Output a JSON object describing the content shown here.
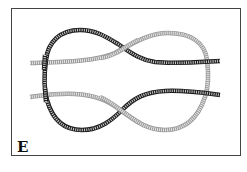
{
  "figure": {
    "panel_label": "E",
    "caption_partial": "Figure E",
    "ropes": [
      {
        "name": "dark-rope",
        "color": "#2b2b2b"
      },
      {
        "name": "light-rope",
        "color": "#a8a8a8"
      }
    ],
    "frame_color": "#444444"
  }
}
